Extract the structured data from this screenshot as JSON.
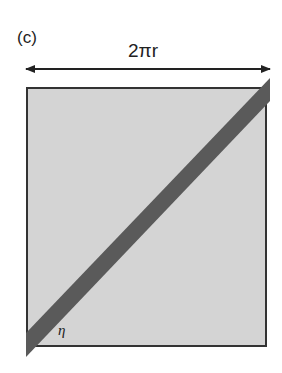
{
  "figure": {
    "panel_label": "(c)",
    "dimension_label": "2πr",
    "angle_label": "η",
    "colors": {
      "square_fill": "#d4d4d4",
      "square_border": "#333333",
      "stripe_fill": "#5a5a5a",
      "arrow": "#222222"
    }
  }
}
